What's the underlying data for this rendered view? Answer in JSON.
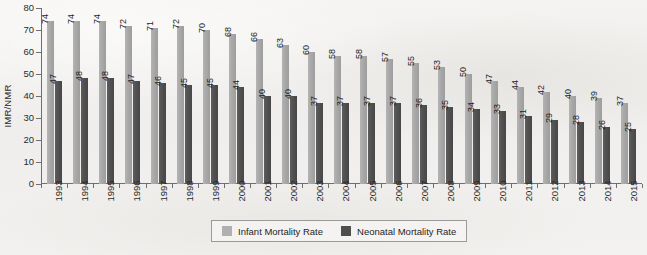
{
  "chart_data": {
    "type": "bar",
    "title": "",
    "subtitle": "",
    "xlabel": "",
    "ylabel": "IMR/NMR",
    "ylim": [
      0,
      80
    ],
    "ytick_step": 10,
    "yticks": [
      80,
      70,
      60,
      50,
      40,
      30,
      20,
      10,
      0
    ],
    "grid": false,
    "legend_position": "bottom-center",
    "categories": [
      "1993",
      "1994",
      "1995",
      "1996",
      "1997",
      "1998",
      "1999",
      "2000",
      "2001",
      "2002",
      "2003",
      "2004",
      "2005",
      "2006",
      "2007",
      "2008",
      "2009",
      "2010",
      "2011",
      "2012",
      "2013",
      "2014",
      "2015"
    ],
    "series": [
      {
        "name": "Infant Mortality Rate",
        "color": "#a9a9a9",
        "values": [
          74,
          74,
          74,
          72,
          71,
          72,
          70,
          68,
          66,
          63,
          60,
          58,
          58,
          57,
          55,
          53,
          50,
          47,
          44,
          42,
          40,
          39,
          37
        ]
      },
      {
        "name": "Neonatal Mortality Rate",
        "color": "#4e4e4e",
        "values": [
          47,
          48,
          48,
          47,
          46,
          45,
          45,
          44,
          40,
          40,
          37,
          37,
          37,
          37,
          36,
          35,
          34,
          33,
          31,
          29,
          28,
          26,
          25
        ]
      }
    ]
  }
}
